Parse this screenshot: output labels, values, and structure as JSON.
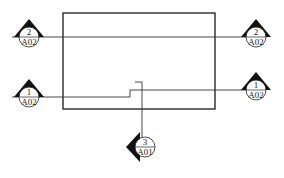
{
  "diagram": {
    "type": "architectural-plan-section-markers",
    "colors": {
      "line": "#1a1a1a",
      "marker_fill": "#111111",
      "background": "#ffffff"
    },
    "markers": [
      {
        "id": "left-2",
        "number": "2",
        "sheet": "A02",
        "direction": "up"
      },
      {
        "id": "right-2",
        "number": "2",
        "sheet": "A02",
        "direction": "up"
      },
      {
        "id": "left-1",
        "number": "1",
        "sheet": "A02",
        "direction": "up"
      },
      {
        "id": "right-1",
        "number": "1",
        "sheet": "A02",
        "direction": "up"
      },
      {
        "id": "bottom-3",
        "number": "3",
        "sheet": "A01",
        "direction": "left"
      }
    ]
  }
}
